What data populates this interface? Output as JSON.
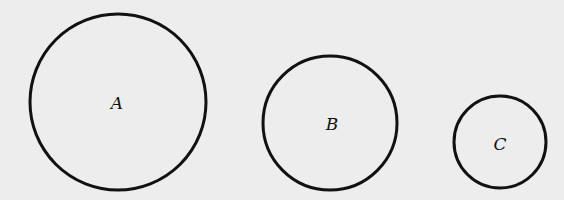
{
  "figure": {
    "background": "#ededed",
    "stroke_color": "#111111",
    "stroke_width": 3,
    "circles": [
      {
        "label": "A",
        "cx": 118,
        "cy": 102,
        "r": 88,
        "label_x": 117,
        "label_y": 109
      },
      {
        "label": "B",
        "cx": 330,
        "cy": 123,
        "r": 67,
        "label_x": 332,
        "label_y": 130
      },
      {
        "label": "C",
        "cx": 500,
        "cy": 142,
        "r": 46,
        "label_x": 500,
        "label_y": 150
      }
    ]
  }
}
